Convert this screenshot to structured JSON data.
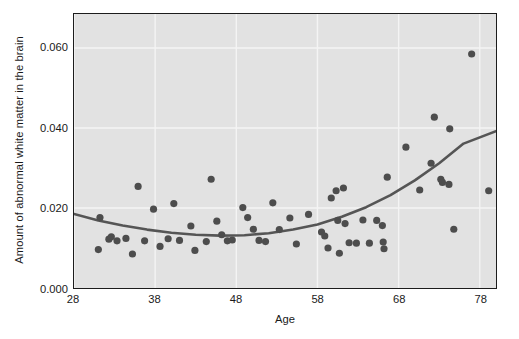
{
  "chart_data": {
    "type": "scatter",
    "title": "",
    "xlabel": "Age",
    "ylabel": "Amount of abnormal white matter in the brain",
    "xlim": [
      28,
      80
    ],
    "ylim": [
      0.0,
      0.0685
    ],
    "xticks": [
      28,
      38,
      48,
      58,
      68,
      78
    ],
    "xtick_labels": [
      "28",
      "38",
      "48",
      "58",
      "68",
      "78"
    ],
    "yticks": [
      0.0,
      0.02,
      0.04,
      0.06
    ],
    "ytick_labels": [
      "0.000",
      "0.020",
      "0.040",
      "0.060"
    ],
    "grid": true,
    "grid_color": "#f4f4f4",
    "plot_bg_color": "#e2e2e2",
    "figure_bg_color": "#ffffff",
    "point_color": "#4d4d4d",
    "point_size": 7.2,
    "legend": null,
    "series": [
      {
        "name": "Observations",
        "marker": "filled-circle",
        "points": [
          [
            31.2,
            0.0176
          ],
          [
            31.0,
            0.0096
          ],
          [
            32.3,
            0.0122
          ],
          [
            32.6,
            0.0128
          ],
          [
            33.3,
            0.0118
          ],
          [
            34.4,
            0.0124
          ],
          [
            35.2,
            0.0085
          ],
          [
            35.9,
            0.0254
          ],
          [
            36.7,
            0.0118
          ],
          [
            37.8,
            0.0197
          ],
          [
            38.6,
            0.0104
          ],
          [
            39.6,
            0.0123
          ],
          [
            40.3,
            0.0211
          ],
          [
            41.0,
            0.0119
          ],
          [
            42.4,
            0.0155
          ],
          [
            42.9,
            0.0094
          ],
          [
            44.3,
            0.0116
          ],
          [
            44.9,
            0.0272
          ],
          [
            45.6,
            0.0167
          ],
          [
            46.2,
            0.0133
          ],
          [
            46.9,
            0.0118
          ],
          [
            47.5,
            0.012
          ],
          [
            48.8,
            0.0201
          ],
          [
            49.4,
            0.0176
          ],
          [
            50.1,
            0.0147
          ],
          [
            50.8,
            0.0119
          ],
          [
            51.6,
            0.0116
          ],
          [
            52.5,
            0.0213
          ],
          [
            53.3,
            0.0146
          ],
          [
            54.6,
            0.0175
          ],
          [
            55.4,
            0.011
          ],
          [
            56.9,
            0.0184
          ],
          [
            58.5,
            0.014
          ],
          [
            58.9,
            0.013
          ],
          [
            59.3,
            0.01
          ],
          [
            59.7,
            0.0225
          ],
          [
            60.3,
            0.0243
          ],
          [
            60.5,
            0.0169
          ],
          [
            60.7,
            0.0087
          ],
          [
            61.2,
            0.025
          ],
          [
            61.4,
            0.0161
          ],
          [
            61.9,
            0.0113
          ],
          [
            62.8,
            0.0112
          ],
          [
            63.6,
            0.017
          ],
          [
            64.4,
            0.0112
          ],
          [
            65.3,
            0.0169
          ],
          [
            66.0,
            0.0156
          ],
          [
            66.1,
            0.0115
          ],
          [
            66.2,
            0.0098
          ],
          [
            66.6,
            0.0277
          ],
          [
            68.9,
            0.0352
          ],
          [
            70.6,
            0.0245
          ],
          [
            72.0,
            0.0312
          ],
          [
            72.4,
            0.0427
          ],
          [
            73.2,
            0.0272
          ],
          [
            73.4,
            0.0264
          ],
          [
            74.2,
            0.0259
          ],
          [
            74.3,
            0.0398
          ],
          [
            74.8,
            0.0147
          ],
          [
            77.0,
            0.0585
          ],
          [
            79.1,
            0.0243
          ]
        ]
      }
    ],
    "fit_curve": {
      "name": "Quadratic fit",
      "color": "#555555",
      "width": 2.6,
      "points": [
        [
          28.0,
          0.0185
        ],
        [
          31.0,
          0.0169
        ],
        [
          34.0,
          0.0156
        ],
        [
          37.0,
          0.0146
        ],
        [
          40.0,
          0.0138
        ],
        [
          43.0,
          0.0133
        ],
        [
          46.0,
          0.0131
        ],
        [
          49.0,
          0.0132
        ],
        [
          52.0,
          0.0137
        ],
        [
          55.0,
          0.0146
        ],
        [
          58.0,
          0.0159
        ],
        [
          61.0,
          0.0178
        ],
        [
          64.0,
          0.0202
        ],
        [
          67.0,
          0.0232
        ],
        [
          70.0,
          0.0269
        ],
        [
          73.0,
          0.0312
        ],
        [
          76.0,
          0.0361
        ],
        [
          80.0,
          0.0392
        ]
      ]
    }
  }
}
